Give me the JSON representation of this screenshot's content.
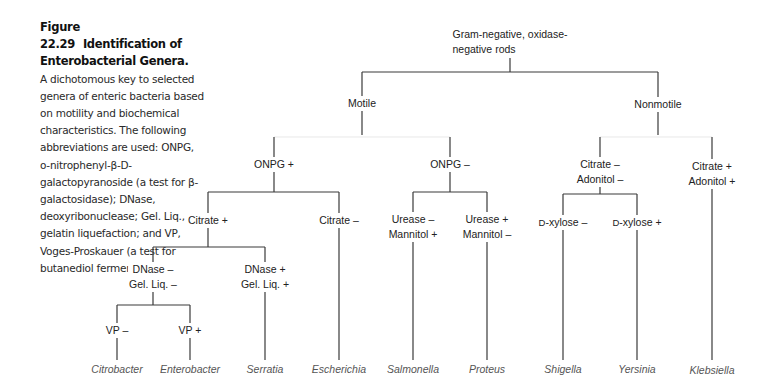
{
  "caption": {
    "figure_number": "Figure 22.29",
    "title": "Identification of Enterobacterial Genera.",
    "body": "A dichotomous key to selected genera of enteric bacteria based on motility and biochemical characteristics. The following abbreviations are used: ONPG, o-nitrophenyl-β-D-galactopyranoside (a test for β-galactosidase); DNase, deoxyribonuclease; Gel. Liq., gelatin liquefaction; and VP, Voges-Proskauer (a test for butanediol fermentation)."
  },
  "tree": {
    "root": {
      "line1": "Gram-negative, oxidase-",
      "line2": "negative rods"
    },
    "motile": "Motile",
    "nonmotile": "Nonmotile",
    "onpg_pos": "ONPG +",
    "onpg_neg": "ONPG –",
    "citrate_pos": "Citrate +",
    "citrate_neg": "Citrate –",
    "dnase_neg": {
      "line1": "DNase –",
      "line2": "Gel. Liq. –"
    },
    "dnase_pos": {
      "line1": "DNase +",
      "line2": "Gel. Liq. +"
    },
    "vp_neg": "VP –",
    "vp_pos": "VP +",
    "urease_neg": {
      "line1": "Urease –",
      "line2": "Mannitol +"
    },
    "urease_pos": {
      "line1": "Urease +",
      "line2": "Mannitol –"
    },
    "citrate_adonitol_neg": {
      "line1": "Citrate –",
      "line2": "Adonitol –"
    },
    "citrate_adonitol_pos": {
      "line1": "Citrate +",
      "line2": "Adonitol +"
    },
    "xylose_neg": {
      "prefix": "D",
      "text": "-xylose –"
    },
    "xylose_pos": {
      "prefix": "D",
      "text": "-xylose +"
    }
  },
  "genera": [
    {
      "name": "Citrobacter",
      "x": 117
    },
    {
      "name": "Enterobacter",
      "x": 190
    },
    {
      "name": "Serratia",
      "x": 265
    },
    {
      "name": "Escherichia",
      "x": 339
    },
    {
      "name": "Salmonella",
      "x": 413
    },
    {
      "name": "Proteus",
      "x": 487
    },
    {
      "name": "Shigella",
      "x": 562
    },
    {
      "name": "Yersinia",
      "x": 636
    },
    {
      "name": "Klebsiella",
      "x": 712
    }
  ],
  "colors": {
    "line": "#3a3a3a",
    "text": "#222222",
    "genus": "#555555"
  }
}
